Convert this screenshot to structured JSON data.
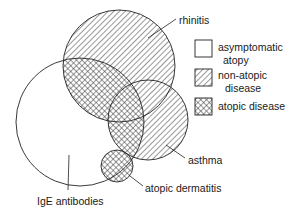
{
  "diagram": {
    "circles": {
      "rhinitis": {
        "cx": 119,
        "cy": 66,
        "r": 56
      },
      "asthma": {
        "cx": 148,
        "cy": 120,
        "r": 40
      },
      "dermatitis": {
        "cx": 117,
        "cy": 166,
        "r": 16
      },
      "ige": {
        "cx": 80,
        "cy": 122,
        "r": 64
      }
    },
    "labels": {
      "rhinitis": "rhinitis",
      "asthma": "asthma",
      "atopic_dermatitis": "atopic dermatitis",
      "ige_antibodies": "IgE antibodies"
    },
    "legend": {
      "items": [
        {
          "pattern": "none",
          "line1": "asymptomatic",
          "line2": "atopy"
        },
        {
          "pattern": "diagonal-hatch",
          "line1": "non-atopic",
          "line2": "disease"
        },
        {
          "pattern": "cross-hatch",
          "line1": "atopic disease",
          "line2": ""
        }
      ]
    },
    "colors": {
      "stroke": "#222222",
      "background": "#ffffff"
    }
  }
}
